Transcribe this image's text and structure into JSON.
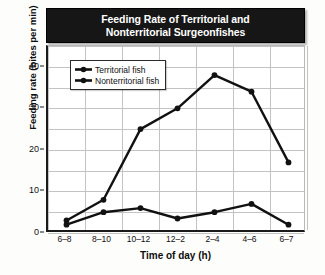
{
  "chart_data": {
    "type": "line",
    "title": "Feeding Rate of Territorial and Nonterritorial Surgeonfishes",
    "title_line1": "Feeding Rate of Territorial and",
    "title_line2": "Nonterritorial Surgeonfishes",
    "xlabel": "Time of day (h)",
    "ylabel": "Feeding rate (bites per min)",
    "categories": [
      "6–8",
      "8–10",
      "10–12",
      "12–2",
      "2–4",
      "4–6",
      "6–7"
    ],
    "yticks": [
      0,
      10,
      20,
      30,
      40
    ],
    "ylim": [
      0,
      45
    ],
    "grid": true,
    "legend_position": "upper-left-inside",
    "series": [
      {
        "name": "Territorial fish",
        "marker": "circle",
        "color": "#111111",
        "values": [
          2,
          5,
          6,
          3.5,
          5,
          7,
          2
        ]
      },
      {
        "name": "Nonterritorial fish",
        "marker": "circle",
        "color": "#111111",
        "values": [
          3,
          8,
          25,
          30,
          38,
          34,
          17
        ]
      }
    ]
  },
  "legend": {
    "items": [
      {
        "label": "Territorial fish"
      },
      {
        "label": "Nonterritorial fish"
      }
    ]
  }
}
